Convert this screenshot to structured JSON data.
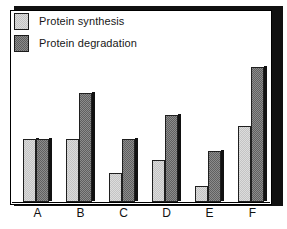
{
  "chart_data": {
    "type": "bar",
    "title": "",
    "subtitle": "",
    "xlabel": "",
    "ylabel": "",
    "categories": [
      "A",
      "B",
      "C",
      "D",
      "E",
      "F"
    ],
    "series": [
      {
        "name": "Protein synthesis",
        "swatch": "light-gray",
        "color": "#dcdcdc",
        "values": [
          63,
          63,
          29,
          42,
          16,
          76
        ]
      },
      {
        "name": "Protein degradation",
        "swatch": "dark-gray",
        "color": "#8c8c8c",
        "values": [
          63,
          109,
          63,
          87,
          51,
          135
        ]
      }
    ],
    "ylim": [
      0,
      170
    ],
    "grid": false,
    "y_axis_ticks": false,
    "legend_position": "top-left",
    "annotations": []
  },
  "legend": {
    "items": [
      {
        "label": "Protein synthesis"
      },
      {
        "label": "Protein degradation"
      }
    ]
  },
  "axis": {
    "tick_labels": [
      "A",
      "B",
      "C",
      "D",
      "E",
      "F"
    ]
  },
  "colors": {
    "bar_light": "#dcdcdc",
    "bar_light_dither": "#c4c4c4",
    "bar_dark": "#8c8c8c",
    "bar_dark_dither": "#606060",
    "outline": "#1f1f1f",
    "shadow": "#111111",
    "frame": "#000000",
    "background": "#ffffff",
    "text": "#171717"
  }
}
